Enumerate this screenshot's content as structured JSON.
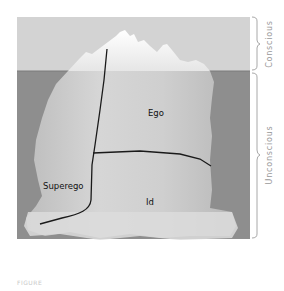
{
  "diagram": {
    "regions": {
      "ego": "Ego",
      "superego": "Superego",
      "id": "Id"
    },
    "levels": {
      "conscious": "Conscious",
      "unconscious": "Unconscious"
    },
    "colors": {
      "sky": "#d3d3d3",
      "water": "#8c8c8c",
      "ice_above": "#f2f2f2",
      "ice_below": "#c9c9c9",
      "divider_line": "#1a1a1a",
      "brace": "#a8a8a8"
    }
  },
  "caption": "FIGURE"
}
